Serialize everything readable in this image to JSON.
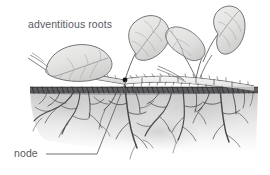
{
  "figure": {
    "type": "botanical-illustration",
    "background_color": "#ffffff",
    "width": 270,
    "height": 175
  },
  "labels": [
    {
      "id": "adventitious-roots",
      "text": "adventitious roots",
      "x": 28,
      "y": 28,
      "color": "#5a5a5e",
      "leader": false
    },
    {
      "id": "node",
      "text": "node",
      "x": 14,
      "y": 157,
      "color": "#5a5a5e",
      "leader": true
    }
  ],
  "leader_line": {
    "color": "#6b6b70",
    "from_x": 46,
    "from_y": 154,
    "elbow_x": 97,
    "elbow_y": 154,
    "to_x": 126,
    "to_y": 80
  },
  "node_marker": {
    "x": 125,
    "y": 80,
    "radius": 2.2,
    "color": "#1a1a1a"
  },
  "soil": {
    "surface_y": 88,
    "band_height": 7,
    "surface_color": "#3a3a3c",
    "body_color": "#cfcfcf",
    "left_x": 30,
    "right_x": 258,
    "depth": 62
  },
  "palette": {
    "leaf_fill": "#e4e4e2",
    "leaf_fill_shadow": "#d2d2d0",
    "leaf_outline": "#6e6e72",
    "stem_fill": "#ededeb",
    "stem_outline": "#5e5e62",
    "root_color": "#4a4a4e",
    "soil_texture": "#b8b8b8",
    "ink": "#3a3a3c"
  },
  "plant": {
    "stolon_label": "horizontal stolon",
    "leaves": [
      {
        "id": "leaf-left",
        "position": "left",
        "tilt": "tilted-right"
      },
      {
        "id": "leaf-center",
        "position": "center",
        "tilt": "upright"
      },
      {
        "id": "leaf-right-lower",
        "position": "right-lower",
        "tilt": "angled-left"
      },
      {
        "id": "leaf-right-upper",
        "position": "right-upper",
        "tilt": "upright"
      }
    ],
    "root_clusters": [
      {
        "id": "root-cluster-left",
        "origin_x": 72,
        "origin_y": 92
      },
      {
        "id": "root-cluster-node",
        "origin_x": 125,
        "origin_y": 90
      },
      {
        "id": "root-cluster-middle",
        "origin_x": 175,
        "origin_y": 92
      },
      {
        "id": "root-cluster-right",
        "origin_x": 222,
        "origin_y": 91
      }
    ]
  }
}
